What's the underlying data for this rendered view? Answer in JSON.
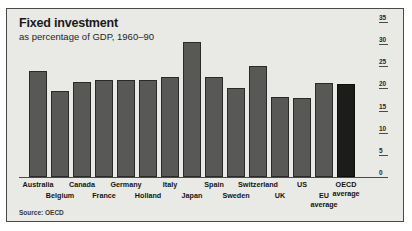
{
  "chart_data": {
    "type": "bar",
    "title": "Fixed investment",
    "subtitle": "as percentage of GDP, 1960–90",
    "source": "Source: OECD",
    "xlabel": "",
    "ylabel": "",
    "ylim": [
      0,
      35
    ],
    "yticks": [
      0,
      5,
      10,
      15,
      20,
      25,
      30,
      35
    ],
    "grid": false,
    "legend": "none",
    "categories": [
      "Australia",
      "Belgium",
      "Canada",
      "France",
      "Germany",
      "Holland",
      "Italy",
      "Japan",
      "Spain",
      "Sweden",
      "Switzerland",
      "UK",
      "US",
      "EU average",
      "OECD average"
    ],
    "values": [
      24,
      19.5,
      21.5,
      22,
      22,
      22,
      22.5,
      30.5,
      22.5,
      20.2,
      25,
      18,
      17.8,
      21.2,
      21
    ],
    "highlight_category": "OECD average",
    "highlight_color": "#1c1c1a",
    "bar_color": "#585856",
    "background_color": "#e9e9e6"
  },
  "axis_labels": [
    {
      "text": "Australia",
      "row": 1
    },
    {
      "text": "Belgium",
      "row": 2
    },
    {
      "text": "Canada",
      "row": 1
    },
    {
      "text": "France",
      "row": 2
    },
    {
      "text": "Germany",
      "row": 1
    },
    {
      "text": "Holland",
      "row": 2
    },
    {
      "text": "Italy",
      "row": 1
    },
    {
      "text": "Japan",
      "row": 2
    },
    {
      "text": "Spain",
      "row": 1
    },
    {
      "text": "Sweden",
      "row": 2
    },
    {
      "text": "Switzerland",
      "row": 1
    },
    {
      "text": "UK",
      "row": 2
    },
    {
      "text": "US",
      "row": 1
    },
    {
      "text": "EU",
      "row": 2,
      "line2": "average"
    },
    {
      "text": "OECD",
      "row": 1,
      "line2": "average"
    }
  ]
}
